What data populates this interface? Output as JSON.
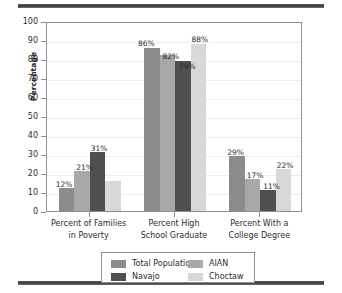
{
  "chart_data": {
    "type": "bar",
    "title": "",
    "subtitle": "",
    "xlabel": "",
    "ylabel": "Percentage",
    "ylim": [
      0,
      100
    ],
    "ytick_step": 10,
    "yticks": [
      0,
      10,
      20,
      30,
      40,
      50,
      60,
      70,
      80,
      90,
      100
    ],
    "grid": true,
    "legend_position": "bottom",
    "categories": [
      "Percent of Families\nin Poverty",
      "Percent High\nSchool Graduate",
      "Percent With a\nCollege Degree"
    ],
    "category_lines": [
      [
        "Percent of Families",
        "in Poverty"
      ],
      [
        "Percent High",
        "School Graduate"
      ],
      [
        "Percent With a",
        "College Degree"
      ]
    ],
    "series": [
      {
        "name": "Total Population",
        "color": "#8c8c8c",
        "values": [
          12,
          86,
          29
        ],
        "labels": [
          "12%",
          "86%",
          "29%"
        ]
      },
      {
        "name": "AIAN",
        "color": "#a8a8a8",
        "values": [
          21,
          82,
          17
        ],
        "labels": [
          "21%",
          "82%",
          "17%"
        ]
      },
      {
        "name": "Navajo",
        "color": "#4f4f4f",
        "values": [
          31,
          79,
          11
        ],
        "labels": [
          "31%",
          "79%",
          "11%"
        ]
      },
      {
        "name": "Choctaw",
        "color": "#d8d8d8",
        "values": [
          16,
          88,
          22
        ],
        "labels": [
          "",
          "88%",
          "22%"
        ]
      }
    ]
  },
  "legend": {
    "entries": [
      {
        "label": "Total Population",
        "color": "#8c8c8c"
      },
      {
        "label": "AIAN",
        "color": "#a8a8a8"
      },
      {
        "label": "Navajo",
        "color": "#4f4f4f"
      },
      {
        "label": "Choctaw",
        "color": "#d8d8d8"
      }
    ]
  },
  "axis": {
    "y_title": "Percentage",
    "y_tick_labels": [
      "100",
      "90",
      "80",
      "70",
      "60",
      "50",
      "40",
      "30",
      "20",
      "10",
      "0"
    ]
  },
  "colors": {
    "rule": "#3a3a3a",
    "frame": "#8e8e8e",
    "gridline": "#ededed",
    "text": "#2b2b2b",
    "background": "#ffffff"
  }
}
